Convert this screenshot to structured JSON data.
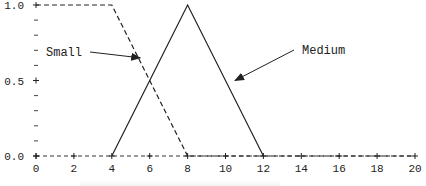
{
  "chart_data": {
    "type": "line",
    "title": "",
    "xlabel": "",
    "ylabel": "",
    "xlim": [
      0,
      20
    ],
    "ylim": [
      0,
      1.0
    ],
    "x_ticks": [
      0,
      2,
      4,
      6,
      8,
      10,
      12,
      14,
      16,
      18,
      20
    ],
    "x_tick_labels": [
      "0",
      "2",
      "4",
      "6",
      "8",
      "10",
      "12",
      "14",
      "16",
      "18",
      "20"
    ],
    "y_ticks_labeled": [
      0.0,
      0.5,
      1.0
    ],
    "y_tick_labels": [
      "0.0",
      "0.5",
      "1.0"
    ],
    "y_minor_ticks": [
      0.1,
      0.2,
      0.3,
      0.4,
      0.6,
      0.7,
      0.8,
      0.9
    ],
    "grid": false,
    "legend": null,
    "series": [
      {
        "name": "Small",
        "style": "dashed",
        "color": "#222222",
        "x": [
          0,
          4,
          8,
          20
        ],
        "y": [
          1.0,
          1.0,
          0.0,
          0.0
        ]
      },
      {
        "name": "Medium",
        "style": "solid",
        "color": "#222222",
        "x": [
          4,
          8,
          12
        ],
        "y": [
          0.0,
          1.0,
          0.0
        ]
      }
    ],
    "annotations": [
      {
        "text": "Small",
        "arrow_to": {
          "x": 5.5,
          "y": 0.65
        }
      },
      {
        "text": "Medium",
        "arrow_to": {
          "x": 10.5,
          "y": 0.5
        }
      }
    ]
  }
}
